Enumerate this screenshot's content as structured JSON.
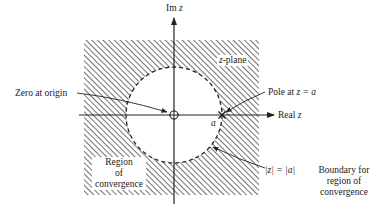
{
  "figure": {
    "type": "z-plane region of convergence diagram",
    "axes": {
      "vertical_label_prefix": "Im",
      "vertical_label_var": "z",
      "horizontal_label_prefix": "Real",
      "horizontal_label_var": "z"
    },
    "plane_label_var": "z",
    "plane_label_suffix": "-plane",
    "annotations": {
      "zero": "Zero at origin",
      "pole_prefix": "Pole at",
      "pole_eq": "z = a",
      "pole_point_label": "a",
      "boundary_eq": "|z| = |a|",
      "boundary_text_line1": "Boundary for",
      "boundary_text_line2": "region of",
      "boundary_text_line3": "convergence",
      "region_line1": "Region",
      "region_line2": "of",
      "region_line3": "convergence"
    },
    "geometry": {
      "origin": [
        174,
        115
      ],
      "pole_radius_px": 48,
      "shaded_square": {
        "x": 84,
        "y": 40,
        "w": 175,
        "h": 155
      }
    },
    "colors": {
      "ink": "#222222",
      "hatch": "#444444",
      "background": "#ffffff"
    }
  }
}
